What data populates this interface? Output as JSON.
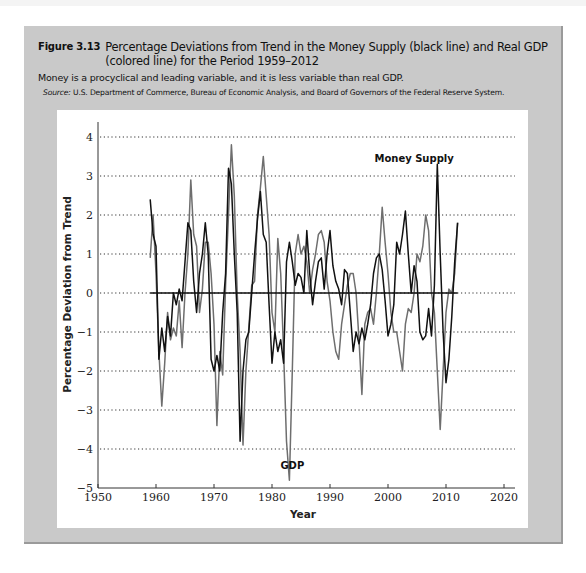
{
  "figure": {
    "number": "Figure 3.13",
    "title": "Percentage Deviations from Trend in the Money Supply (black line) and Real GDP (colored line) for the Period 1959–2012",
    "subtitle": "Money is a procyclical and leading variable, and it is less variable than real GDP.",
    "source_label": "Source:",
    "source_text": "U.S. Department of Commerce, Bureau of Economic Analysis, and Board of Governors of the Federal Reserve System."
  },
  "colors": {
    "panel_bg": "#c9c9c9",
    "money_supply": "#111111",
    "gdp": "#6e6e6e",
    "grid": "#333333"
  },
  "chart_data": {
    "type": "line",
    "title": "Percentage Deviations from Trend in the Money Supply (black line) and Real GDP (colored line) for the Period 1959–2012",
    "xlabel": "Year",
    "ylabel": "Percentage Deviation from Trend",
    "xlim": [
      1950,
      2020
    ],
    "ylim": [
      -5,
      4
    ],
    "x_ticks": [
      1950,
      1960,
      1970,
      1980,
      1990,
      2000,
      2010,
      2020
    ],
    "y_ticks": [
      4,
      3,
      2,
      1,
      0,
      -1,
      -2,
      -3,
      -4,
      -5
    ],
    "grid": "horizontal dotted",
    "zero_line": {
      "from": 1959,
      "to": 2012
    },
    "annotations": [
      {
        "text": "Money Supply",
        "x": 2004.5,
        "y": 3.35
      },
      {
        "text": "GDP",
        "x": 1983.5,
        "y": -4.5
      }
    ],
    "x": [
      1959,
      1959.5,
      1960,
      1960.5,
      1961,
      1961.5,
      1962,
      1962.5,
      1963,
      1963.5,
      1964,
      1964.5,
      1965,
      1965.5,
      1966,
      1966.5,
      1967,
      1967.5,
      1968,
      1968.5,
      1969,
      1969.5,
      1970,
      1970.5,
      1971,
      1971.5,
      1972,
      1972.5,
      1973,
      1973.5,
      1974,
      1974.5,
      1975,
      1975.5,
      1976,
      1976.5,
      1977,
      1977.5,
      1978,
      1978.5,
      1979,
      1979.5,
      1980,
      1980.5,
      1981,
      1981.5,
      1982,
      1982.5,
      1983,
      1983.5,
      1984,
      1984.5,
      1985,
      1985.5,
      1986,
      1986.5,
      1987,
      1987.5,
      1988,
      1988.5,
      1989,
      1989.5,
      1990,
      1990.5,
      1991,
      1991.5,
      1992,
      1992.5,
      1993,
      1993.5,
      1994,
      1994.5,
      1995,
      1995.5,
      1996,
      1996.5,
      1997,
      1997.5,
      1998,
      1998.5,
      1999,
      1999.5,
      2000,
      2000.5,
      2001,
      2001.5,
      2002,
      2002.5,
      2003,
      2003.5,
      2004,
      2004.5,
      2005,
      2005.5,
      2006,
      2006.5,
      2007,
      2007.5,
      2008,
      2008.5,
      2009,
      2009.5,
      2010,
      2010.5,
      2011,
      2011.5,
      2012
    ],
    "series": [
      {
        "name": "Money Supply",
        "color": "#111111",
        "values": [
          2.4,
          1.5,
          1.2,
          -1.7,
          -0.9,
          -1.5,
          -0.6,
          -1.1,
          0.0,
          -0.3,
          0.1,
          -0.2,
          0.8,
          1.8,
          1.6,
          0.3,
          -0.5,
          0.5,
          1.0,
          1.8,
          1.0,
          -1.7,
          -2.0,
          -1.6,
          -2.0,
          -0.5,
          0.5,
          3.2,
          2.8,
          1.0,
          -0.5,
          -3.8,
          -2.0,
          -1.2,
          -1.0,
          0.0,
          1.0,
          1.9,
          2.6,
          1.5,
          1.3,
          -0.3,
          -1.8,
          -1.0,
          -1.5,
          -1.2,
          -1.8,
          0.8,
          1.3,
          0.8,
          0.2,
          0.5,
          0.4,
          0.0,
          1.6,
          0.5,
          -0.3,
          0.3,
          0.8,
          0.9,
          0.1,
          1.0,
          1.6,
          0.7,
          0.3,
          0.1,
          -0.3,
          0.6,
          0.5,
          -0.5,
          -1.5,
          -1.0,
          -1.3,
          -0.9,
          -1.2,
          -0.8,
          -0.3,
          0.5,
          0.9,
          1.0,
          0.6,
          -0.2,
          -1.1,
          -0.8,
          -0.3,
          1.3,
          1.0,
          1.5,
          2.1,
          1.0,
          0.0,
          0.7,
          0.3,
          -1.0,
          -1.2,
          -1.1,
          -0.4,
          -1.1,
          0.2,
          3.3,
          1.0,
          -1.0,
          -2.3,
          -1.7,
          -0.6,
          0.8,
          1.8
        ]
      },
      {
        "name": "GDP",
        "color": "#6e6e6e",
        "values": [
          0.9,
          2.0,
          0.5,
          -1.5,
          -2.9,
          -1.8,
          -0.5,
          -1.2,
          -0.9,
          -1.1,
          -0.2,
          -1.4,
          0.0,
          1.0,
          2.9,
          1.5,
          1.2,
          -0.5,
          0.1,
          1.3,
          1.3,
          0.5,
          -0.8,
          -3.4,
          -1.5,
          -2.1,
          0.2,
          2.0,
          3.8,
          2.5,
          0.0,
          -1.5,
          -3.9,
          -2.0,
          -0.9,
          0.2,
          0.3,
          2.0,
          2.7,
          3.5,
          2.5,
          1.5,
          -0.5,
          -1.0,
          1.4,
          0.5,
          -1.5,
          -3.8,
          -4.8,
          -2.0,
          1.0,
          1.5,
          1.0,
          1.2,
          0.8,
          0.0,
          0.6,
          1.0,
          1.5,
          1.6,
          1.3,
          0.3,
          -0.2,
          -1.0,
          -1.5,
          -1.7,
          -0.8,
          -0.3,
          0.2,
          0.5,
          0.5,
          0.0,
          -1.2,
          -2.6,
          -0.8,
          -0.5,
          -0.4,
          -0.8,
          0.0,
          1.0,
          2.2,
          1.3,
          0.5,
          -0.5,
          -1.0,
          -1.0,
          -1.5,
          -2.0,
          -0.8,
          -0.4,
          -0.5,
          0.0,
          1.0,
          0.8,
          1.2,
          2.0,
          1.6,
          0.0,
          -0.5,
          -2.0,
          -3.5,
          -2.0,
          -0.5,
          0.1,
          0.0,
          0.5,
          1.8
        ]
      }
    ]
  }
}
